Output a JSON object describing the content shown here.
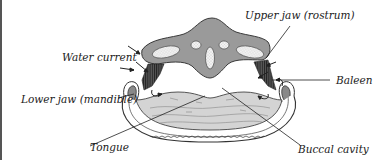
{
  "diagram": {
    "labels": {
      "upper_jaw": "Upper jaw (rostrum)",
      "water_current": "Water current",
      "baleen": "Baleen",
      "lower_jaw": "Lower jaw (mandible)",
      "tongue": "Tongue",
      "buccal_cavity": "Buccal cavity"
    },
    "colors": {
      "rostrum_fill": "#9a9a9a",
      "rostrum_stroke": "#3a3a3a",
      "bone_fill": "#efefef",
      "baleen_fill": "#4a4a4a",
      "tongue_fill": "#d4d4d4",
      "line": "#222222",
      "frame_border": "#555555"
    }
  }
}
